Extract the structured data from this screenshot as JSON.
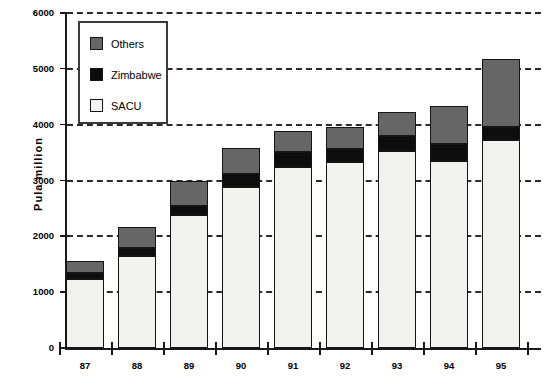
{
  "chart_data": {
    "type": "bar",
    "stacked": true,
    "title": "",
    "xlabel": "",
    "ylabel": "Pula   million",
    "categories": [
      "87",
      "88",
      "89",
      "90",
      "91",
      "92",
      "93",
      "94",
      "95"
    ],
    "series": [
      {
        "name": "SACU",
        "color": "#f2f2f0",
        "values": [
          1240,
          1650,
          2390,
          2890,
          3250,
          3330,
          3520,
          3350,
          3720
        ]
      },
      {
        "name": "Zimbabwe",
        "color": "#0d0d0d",
        "values": [
          100,
          135,
          145,
          230,
          260,
          230,
          270,
          305,
          230
        ]
      },
      {
        "name": "Others",
        "color": "#666666",
        "values": [
          220,
          385,
          465,
          460,
          380,
          390,
          440,
          685,
          1225
        ]
      }
    ],
    "totals": [
      1560,
      2170,
      3000,
      3580,
      3890,
      3950,
      4230,
      4340,
      5175
    ],
    "ylim": [
      0,
      6000
    ],
    "yticks": [
      0,
      1000,
      2000,
      3000,
      4000,
      5000,
      6000
    ],
    "ytick_labels": [
      "0",
      "1000",
      "2000",
      "3000",
      "4000",
      "5000",
      "6000"
    ],
    "grid": "horizontal-dashed",
    "legend_position": "top-left",
    "legend_entries": [
      "Others",
      "Zimbabwe",
      "SACU"
    ]
  },
  "legend": {
    "items": [
      {
        "label": "Others",
        "swatch": "others-swatch"
      },
      {
        "label": "Zimbabwe",
        "swatch": "zimbabwe-swatch"
      },
      {
        "label": "SACU",
        "swatch": "sacu-swatch"
      }
    ]
  },
  "axes": {
    "y_title": "Pula   million",
    "y_labels": [
      "6000",
      "5000",
      "4000",
      "3000",
      "2000",
      "1000",
      "0"
    ],
    "x_labels": [
      "87",
      "88",
      "89",
      "90",
      "91",
      "92",
      "93",
      "94",
      "95"
    ]
  },
  "colors": {
    "others": "#666666",
    "zimbabwe": "#0d0d0d",
    "sacu": "#f2f2f0",
    "axis": "#1a1a1a",
    "grid": "#2b2b2b"
  }
}
